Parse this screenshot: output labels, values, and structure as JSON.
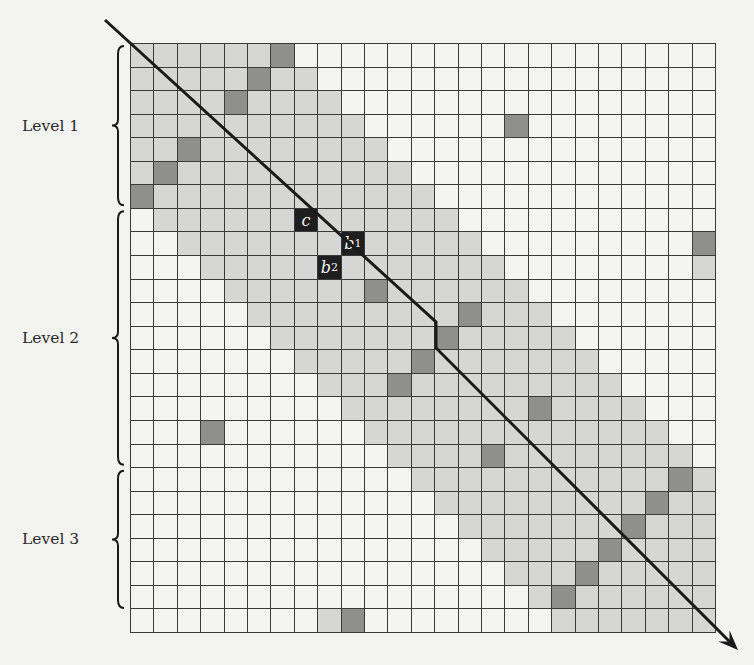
{
  "figure": {
    "rows": 25,
    "cols": 25,
    "band_halfwidth": 6,
    "colors": {
      "white": "#f4f4f2",
      "light": "#d6d6d4",
      "dark": "#8f8f8d",
      "black": "#1e1e1e",
      "line": "#3a3a3a"
    },
    "dark_cells": [
      [
        0,
        6
      ],
      [
        1,
        5
      ],
      [
        2,
        4
      ],
      [
        3,
        16
      ],
      [
        4,
        2
      ],
      [
        5,
        1
      ],
      [
        6,
        0
      ],
      [
        8,
        24
      ],
      [
        10,
        10
      ],
      [
        11,
        14
      ],
      [
        12,
        13
      ],
      [
        13,
        12
      ],
      [
        14,
        11
      ],
      [
        15,
        17
      ],
      [
        16,
        3
      ],
      [
        17,
        15
      ],
      [
        18,
        23
      ],
      [
        19,
        22
      ],
      [
        20,
        21
      ],
      [
        21,
        20
      ],
      [
        22,
        19
      ],
      [
        23,
        18
      ],
      [
        24,
        9
      ]
    ],
    "extra_light_cells": [
      [
        9,
        24
      ],
      [
        24,
        8
      ]
    ],
    "black_cells": [
      {
        "row": 7,
        "col": 7,
        "label": "c",
        "sub": ""
      },
      {
        "row": 8,
        "col": 9,
        "label": "b",
        "sub": "1"
      },
      {
        "row": 9,
        "col": 8,
        "label": "b",
        "sub": "2"
      }
    ],
    "levels": [
      {
        "label": "Level 1",
        "row_start": 0,
        "row_end": 6
      },
      {
        "label": "Level 2",
        "row_start": 7,
        "row_end": 17
      },
      {
        "label": "Level 3",
        "row_start": 18,
        "row_end": 23
      }
    ],
    "arrow": {
      "description": "Diagonal ordering arrow with one vertical step at row 12",
      "points": [
        [
          105,
          20
        ],
        [
          436,
          322
        ],
        [
          436,
          348
        ],
        [
          738,
          650
        ]
      ]
    }
  }
}
